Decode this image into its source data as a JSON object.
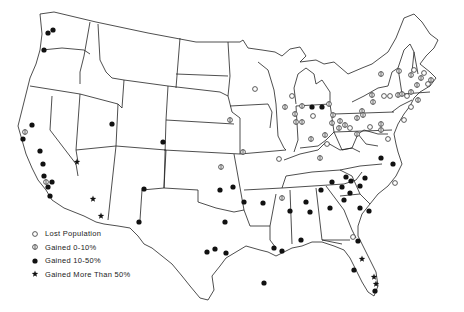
{
  "map": {
    "title": "",
    "region": "Contiguous United States",
    "legend": [
      {
        "symbol": "open-circle",
        "label": "Lost Population"
      },
      {
        "symbol": "barred-circle",
        "label": "Gained 0-10%"
      },
      {
        "symbol": "filled-circle",
        "label": "Gained 10-50%"
      },
      {
        "symbol": "star",
        "label": "Gained More Than 50%"
      }
    ],
    "markers": [
      {
        "x": 53,
        "y": 30,
        "type": "filled"
      },
      {
        "x": 48,
        "y": 33,
        "type": "filled"
      },
      {
        "x": 44,
        "y": 50,
        "type": "filled"
      },
      {
        "x": 32,
        "y": 125,
        "type": "filled"
      },
      {
        "x": 25,
        "y": 132,
        "type": "barred"
      },
      {
        "x": 23,
        "y": 139,
        "type": "filled"
      },
      {
        "x": 40,
        "y": 151,
        "type": "filled"
      },
      {
        "x": 43,
        "y": 164,
        "type": "filled"
      },
      {
        "x": 44,
        "y": 176,
        "type": "filled"
      },
      {
        "x": 46,
        "y": 182,
        "type": "barred"
      },
      {
        "x": 52,
        "y": 182,
        "type": "filled"
      },
      {
        "x": 48,
        "y": 187,
        "type": "filled"
      },
      {
        "x": 50,
        "y": 196,
        "type": "filled"
      },
      {
        "x": 77,
        "y": 162,
        "type": "star"
      },
      {
        "x": 93,
        "y": 199,
        "type": "star"
      },
      {
        "x": 101,
        "y": 216,
        "type": "star"
      },
      {
        "x": 112,
        "y": 124,
        "type": "filled"
      },
      {
        "x": 144,
        "y": 189,
        "type": "filled"
      },
      {
        "x": 139,
        "y": 222,
        "type": "filled"
      },
      {
        "x": 163,
        "y": 142,
        "type": "filled"
      },
      {
        "x": 255,
        "y": 89,
        "type": "open"
      },
      {
        "x": 292,
        "y": 96,
        "type": "open"
      },
      {
        "x": 285,
        "y": 107,
        "type": "barred"
      },
      {
        "x": 295,
        "y": 114,
        "type": "barred"
      },
      {
        "x": 302,
        "y": 106,
        "type": "barred"
      },
      {
        "x": 230,
        "y": 120,
        "type": "barred"
      },
      {
        "x": 243,
        "y": 152,
        "type": "barred"
      },
      {
        "x": 221,
        "y": 167,
        "type": "barred"
      },
      {
        "x": 220,
        "y": 190,
        "type": "filled"
      },
      {
        "x": 233,
        "y": 187,
        "type": "filled"
      },
      {
        "x": 279,
        "y": 159,
        "type": "open"
      },
      {
        "x": 263,
        "y": 203,
        "type": "filled"
      },
      {
        "x": 282,
        "y": 198,
        "type": "barred"
      },
      {
        "x": 312,
        "y": 107,
        "type": "filled"
      },
      {
        "x": 322,
        "y": 107,
        "type": "filled"
      },
      {
        "x": 329,
        "y": 104,
        "type": "barred"
      },
      {
        "x": 296,
        "y": 122,
        "type": "barred"
      },
      {
        "x": 302,
        "y": 122,
        "type": "barred"
      },
      {
        "x": 313,
        "y": 116,
        "type": "open"
      },
      {
        "x": 332,
        "y": 123,
        "type": "barred"
      },
      {
        "x": 333,
        "y": 115,
        "type": "barred"
      },
      {
        "x": 340,
        "y": 121,
        "type": "barred"
      },
      {
        "x": 339,
        "y": 128,
        "type": "barred"
      },
      {
        "x": 345,
        "y": 125,
        "type": "barred"
      },
      {
        "x": 350,
        "y": 128,
        "type": "open"
      },
      {
        "x": 357,
        "y": 118,
        "type": "barred"
      },
      {
        "x": 362,
        "y": 111,
        "type": "barred"
      },
      {
        "x": 370,
        "y": 127,
        "type": "open"
      },
      {
        "x": 381,
        "y": 124,
        "type": "barred"
      },
      {
        "x": 311,
        "y": 139,
        "type": "barred"
      },
      {
        "x": 325,
        "y": 135,
        "type": "barred"
      },
      {
        "x": 327,
        "y": 144,
        "type": "open"
      },
      {
        "x": 320,
        "y": 158,
        "type": "barred"
      },
      {
        "x": 357,
        "y": 134,
        "type": "barred"
      },
      {
        "x": 363,
        "y": 115,
        "type": "barred"
      },
      {
        "x": 372,
        "y": 95,
        "type": "barred"
      },
      {
        "x": 373,
        "y": 102,
        "type": "barred"
      },
      {
        "x": 390,
        "y": 96,
        "type": "open"
      },
      {
        "x": 384,
        "y": 96,
        "type": "open"
      },
      {
        "x": 398,
        "y": 95,
        "type": "barred"
      },
      {
        "x": 399,
        "y": 71,
        "type": "barred"
      },
      {
        "x": 381,
        "y": 74,
        "type": "barred"
      },
      {
        "x": 411,
        "y": 75,
        "type": "barred"
      },
      {
        "x": 402,
        "y": 94,
        "type": "barred"
      },
      {
        "x": 407,
        "y": 96,
        "type": "open"
      },
      {
        "x": 411,
        "y": 92,
        "type": "barred"
      },
      {
        "x": 417,
        "y": 85,
        "type": "barred"
      },
      {
        "x": 421,
        "y": 78,
        "type": "barred"
      },
      {
        "x": 424,
        "y": 73,
        "type": "open"
      },
      {
        "x": 414,
        "y": 70,
        "type": "open"
      },
      {
        "x": 428,
        "y": 84,
        "type": "open"
      },
      {
        "x": 431,
        "y": 80,
        "type": "barred"
      },
      {
        "x": 418,
        "y": 100,
        "type": "barred"
      },
      {
        "x": 411,
        "y": 107,
        "type": "open"
      },
      {
        "x": 404,
        "y": 120,
        "type": "open"
      },
      {
        "x": 388,
        "y": 139,
        "type": "open"
      },
      {
        "x": 381,
        "y": 130,
        "type": "barred"
      },
      {
        "x": 381,
        "y": 158,
        "type": "filled"
      },
      {
        "x": 393,
        "y": 164,
        "type": "filled"
      },
      {
        "x": 395,
        "y": 183,
        "type": "open"
      },
      {
        "x": 365,
        "y": 178,
        "type": "filled"
      },
      {
        "x": 346,
        "y": 177,
        "type": "filled"
      },
      {
        "x": 332,
        "y": 182,
        "type": "filled"
      },
      {
        "x": 342,
        "y": 187,
        "type": "filled"
      },
      {
        "x": 351,
        "y": 181,
        "type": "filled"
      },
      {
        "x": 360,
        "y": 186,
        "type": "filled"
      },
      {
        "x": 321,
        "y": 190,
        "type": "filled"
      },
      {
        "x": 350,
        "y": 193,
        "type": "filled"
      },
      {
        "x": 306,
        "y": 202,
        "type": "filled"
      },
      {
        "x": 330,
        "y": 208,
        "type": "filled"
      },
      {
        "x": 344,
        "y": 200,
        "type": "filled"
      },
      {
        "x": 360,
        "y": 208,
        "type": "filled"
      },
      {
        "x": 369,
        "y": 211,
        "type": "filled"
      },
      {
        "x": 310,
        "y": 212,
        "type": "filled"
      },
      {
        "x": 290,
        "y": 211,
        "type": "filled"
      },
      {
        "x": 274,
        "y": 248,
        "type": "filled"
      },
      {
        "x": 282,
        "y": 251,
        "type": "filled"
      },
      {
        "x": 301,
        "y": 240,
        "type": "filled"
      },
      {
        "x": 358,
        "y": 241,
        "type": "filled"
      },
      {
        "x": 353,
        "y": 237,
        "type": "open"
      },
      {
        "x": 362,
        "y": 259,
        "type": "star"
      },
      {
        "x": 354,
        "y": 270,
        "type": "filled"
      },
      {
        "x": 374,
        "y": 277,
        "type": "star"
      },
      {
        "x": 376,
        "y": 284,
        "type": "star"
      },
      {
        "x": 375,
        "y": 291,
        "type": "filled"
      },
      {
        "x": 207,
        "y": 252,
        "type": "filled"
      },
      {
        "x": 215,
        "y": 249,
        "type": "filled"
      },
      {
        "x": 226,
        "y": 253,
        "type": "filled"
      },
      {
        "x": 225,
        "y": 222,
        "type": "filled"
      },
      {
        "x": 244,
        "y": 202,
        "type": "filled"
      },
      {
        "x": 264,
        "y": 283,
        "type": "filled"
      }
    ]
  }
}
